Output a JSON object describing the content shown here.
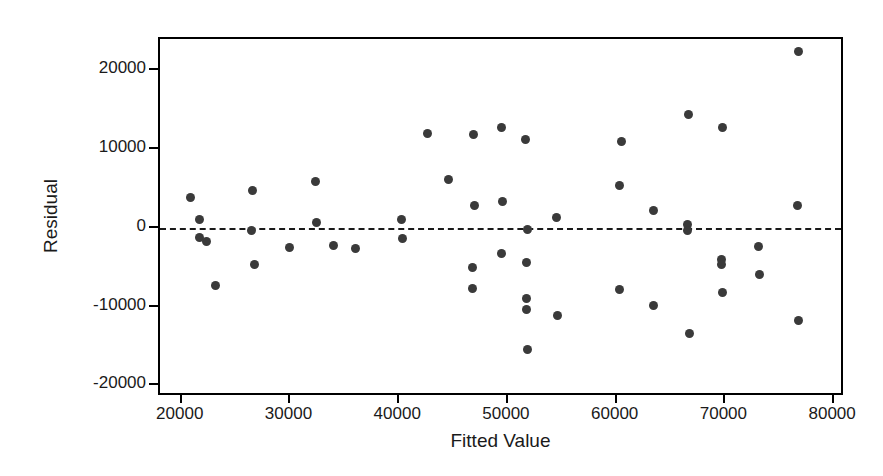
{
  "chart_data": {
    "type": "scatter",
    "title": "",
    "xlabel": "Fitted Value",
    "ylabel": "Residual",
    "xlim": [
      18000,
      81000
    ],
    "ylim": [
      -21500,
      24000
    ],
    "xticks": [
      20000,
      30000,
      40000,
      50000,
      60000,
      70000,
      80000
    ],
    "yticks": [
      20000,
      10000,
      0,
      -10000,
      -20000
    ],
    "xtick_labels": [
      "20000",
      "30000",
      "40000",
      "50000",
      "60000",
      "70000",
      "80000"
    ],
    "ytick_labels": [
      "20000",
      "10000",
      "0",
      "-10000",
      "-20000"
    ],
    "grid": false,
    "legend": "none",
    "reference_line": {
      "name": "zero-residual-line",
      "y": 0,
      "style": "dashed"
    },
    "marker": {
      "shape": "circle",
      "color": "#3a3a3a",
      "size": 9
    },
    "point_count": 48,
    "points": [
      {
        "x": 20800,
        "y": 3900
      },
      {
        "x": 21600,
        "y": 1000
      },
      {
        "x": 21600,
        "y": -1200
      },
      {
        "x": 22300,
        "y": -1700
      },
      {
        "x": 23100,
        "y": -7300
      },
      {
        "x": 26500,
        "y": 4800
      },
      {
        "x": 26400,
        "y": -300
      },
      {
        "x": 26700,
        "y": -4600
      },
      {
        "x": 29900,
        "y": -2500
      },
      {
        "x": 32300,
        "y": 5900
      },
      {
        "x": 32400,
        "y": 700
      },
      {
        "x": 34000,
        "y": -2200
      },
      {
        "x": 36000,
        "y": -2600
      },
      {
        "x": 40200,
        "y": 1100
      },
      {
        "x": 40300,
        "y": -1300
      },
      {
        "x": 42600,
        "y": 12000
      },
      {
        "x": 44500,
        "y": 6100
      },
      {
        "x": 46800,
        "y": 11800
      },
      {
        "x": 46900,
        "y": 2900
      },
      {
        "x": 46700,
        "y": -5000
      },
      {
        "x": 46700,
        "y": -7700
      },
      {
        "x": 49400,
        "y": 12800
      },
      {
        "x": 49500,
        "y": 3400
      },
      {
        "x": 49400,
        "y": -3300
      },
      {
        "x": 51600,
        "y": 11200
      },
      {
        "x": 51800,
        "y": -200
      },
      {
        "x": 51700,
        "y": -4400
      },
      {
        "x": 51700,
        "y": -9000
      },
      {
        "x": 51700,
        "y": -10400
      },
      {
        "x": 51800,
        "y": -15400
      },
      {
        "x": 54500,
        "y": 1300
      },
      {
        "x": 54600,
        "y": -11200
      },
      {
        "x": 60400,
        "y": 11000
      },
      {
        "x": 60300,
        "y": 5400
      },
      {
        "x": 60300,
        "y": -7800
      },
      {
        "x": 63400,
        "y": 2200
      },
      {
        "x": 63400,
        "y": -9900
      },
      {
        "x": 66500,
        "y": 400
      },
      {
        "x": 66500,
        "y": -400
      },
      {
        "x": 66600,
        "y": 14400
      },
      {
        "x": 66700,
        "y": -13400
      },
      {
        "x": 69700,
        "y": 12800
      },
      {
        "x": 69600,
        "y": -4000
      },
      {
        "x": 69600,
        "y": -4700
      },
      {
        "x": 69700,
        "y": -8200
      },
      {
        "x": 73000,
        "y": -2400
      },
      {
        "x": 73100,
        "y": -5900
      },
      {
        "x": 76700,
        "y": 22400
      },
      {
        "x": 76600,
        "y": 2800
      },
      {
        "x": 76700,
        "y": -11800
      }
    ]
  },
  "axes": {
    "x_label": "Fitted Value",
    "y_label": "Residual",
    "x_ticks": [
      "20000",
      "30000",
      "40000",
      "50000",
      "60000",
      "70000",
      "80000"
    ],
    "y_ticks": [
      "20000",
      "10000",
      "0",
      "-10000",
      "-20000"
    ]
  },
  "colors": {
    "marker": "#3a3a3a",
    "axis": "#000000",
    "text": "#1a1a1a",
    "background": "#ffffff"
  }
}
